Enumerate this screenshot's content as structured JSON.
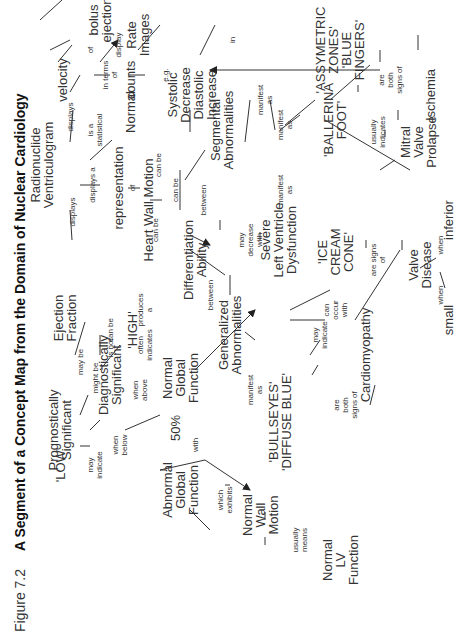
{
  "figure": {
    "number": "Figure 7.2",
    "title": "A Segment of a Concept Map from the Domain of Nuclear Cardiology"
  },
  "concepts": {
    "radionuclide_ventriculogram": "Radionuclide\nVentriculogram",
    "velocity": "velocity",
    "bolus_ejection": "bolus\nejection",
    "counts": "counts",
    "rate_images": "Rate\nImages",
    "representation": "representation",
    "heart_wall_motion": "Heart Wall Motion",
    "normal_hwm": "Normal",
    "systolic_diastolic": "Systolic Decrease\nDiastolic Increase",
    "segmental_abnormalities": "Segmental\nAbnormalities",
    "asymmetric_zones": "'ASSYMETRIC\nZONES'\n'BLUE\nFINGERS'",
    "ischemia": "Ischemia",
    "ballerina_foot": "'BALLERINA\nFOOT'",
    "mitral_valve_prolapse": "Mitral\nValve\nProlapse",
    "ice_cream_cone": "'ICE\nCREAM\nCONE'",
    "valve_disease": "Valve\nDisease",
    "small": "small",
    "inferior": "inferior",
    "differentiation_ability": "Differentiation\nAbility",
    "severe_lv_dysfunction": "Severe\nLeft Ventricle\nDysfunction",
    "generalized_abnormalities": "Generalized\nAbnormalities",
    "cardiomyopathy": "Cardiomyopathy",
    "bullseyes": "'BULLSEYES'\n'DIFFUSE BLUE'",
    "ejection_fraction": "Ejection\nFraction",
    "prognostically_significant": "Prognostically\nSignificant",
    "diagnostically_significant": "Diagnostically\nSignificant",
    "high": "'HIGH'",
    "normal_global_function": "Normal\nGlobal\nFunction",
    "low": "'LOW'",
    "fifty_percent": "50%",
    "abnormal_global_function": "Abnormal\nGlobal\nFunction",
    "normal_wall_motion": "Normal\nWall\nMotion",
    "normal_lv_function": "Normal\nLV\nFunction"
  },
  "links": {
    "rv_displays_ef": "displays",
    "rv_displays_velocity": "displays",
    "rv_displays_a": "displays a",
    "is_a_statistical": "is a\nstatistical",
    "of_velocity": "of",
    "in_terms_of": "in terms\nof",
    "display": "display",
    "rep_of": "of",
    "hwm_can_be_normal": "can be",
    "hwm_can_be_diff": "can be",
    "hwm_can_be_left": "can be",
    "eg": "e.g.",
    "between_seg": "between",
    "manifest_as_1": "manifest\nas",
    "manifest_as_2": "manifest\nas",
    "manifest_as_3": "manifest\nas",
    "in": "in",
    "are_both_signs_of_1": "are\nboth\nsigns of",
    "usually_indicates": "usually\nindicates",
    "are_signs_of": "are signs\nof",
    "when_small": "when",
    "when_inferior": "when",
    "may_decrease_with": "may\ndecrease\nwith",
    "between_gen": "between",
    "can_occur_with": "can\noccur\nwith",
    "may_indicate_cardio": "may\nindicate",
    "manifest_as_gen": "manifest\nas",
    "are_both_signs_of_2": "are\nboth\nsigns of",
    "may_be": "may be",
    "might_be": "might be",
    "is_not": "is not",
    "can_be_high": "can be",
    "produces_a": "produces\na",
    "often_indicates": "often\nindicates",
    "when_above": "when\nabove",
    "when_below": "when\nbelow",
    "may_indicate_low": "may\nindicate",
    "with": "with",
    "which_exhibits": "which\nexhibits",
    "usually_means": "usually\nmeans"
  },
  "colors": {
    "ink": "#222222",
    "background": "#ffffff"
  }
}
